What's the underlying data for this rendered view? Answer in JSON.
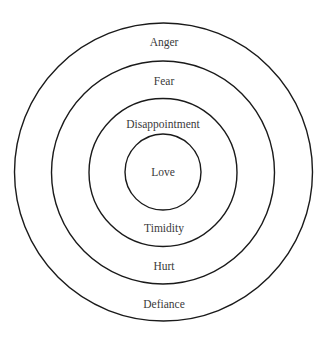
{
  "diagram": {
    "type": "concentric-circles",
    "rings_outer_to_inner": [
      {
        "top_label": "Anger",
        "bottom_label": "Defiance"
      },
      {
        "top_label": "Fear",
        "bottom_label": "Hurt"
      },
      {
        "top_label": "Disappointment",
        "bottom_label": "Timidity"
      },
      {
        "center_label": "Love"
      }
    ],
    "colors": {
      "stroke": "#1a1a1a",
      "text": "#3a3a3a",
      "background": "#ffffff"
    }
  }
}
